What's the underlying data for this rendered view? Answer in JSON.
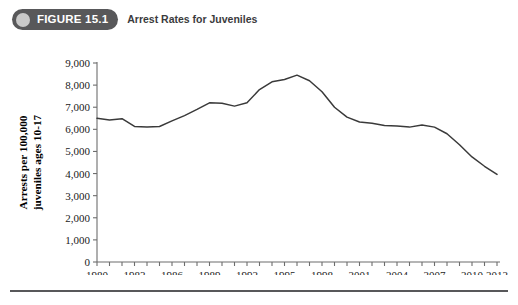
{
  "header": {
    "badge_label": "FIGURE 15.1",
    "badge_icon": "circle-icon",
    "title": "Arrest Rates for Juveniles",
    "badge_color": "#58585a",
    "badge_dot_color": "#c9c9c9",
    "title_color": "#3b3b3d"
  },
  "chart_data": {
    "type": "line",
    "title": "Arrest Rates for Juveniles",
    "xlabel": "",
    "ylabel": "Arrests per 100,000 juveniles ages 10-17",
    "ylabel_line1": "Arrests per 100,000",
    "ylabel_line2": "juveniles ages 10-17",
    "xlim": [
      1980,
      2012
    ],
    "ylim": [
      0,
      9000
    ],
    "ytick_values": [
      0,
      1000,
      2000,
      3000,
      4000,
      5000,
      6000,
      7000,
      8000,
      9000
    ],
    "ytick_labels": [
      "0",
      "1,000",
      "2,000",
      "3,000",
      "4,000",
      "5,000",
      "6,000",
      "7,000",
      "8,000",
      "9,000"
    ],
    "xtick_values": [
      1980,
      1983,
      1986,
      1989,
      1992,
      1995,
      1998,
      2001,
      2004,
      2007,
      2010,
      2012
    ],
    "xtick_labels": [
      "1980",
      "1983",
      "1986",
      "1989",
      "1992",
      "1995",
      "1998",
      "2001",
      "2004",
      "2007",
      "2010",
      "2012"
    ],
    "xtick_minor_every": 1,
    "grid": false,
    "legend": false,
    "line_color": "#3a3a3a",
    "axis_color": "#6d6d6d",
    "x": [
      1980,
      1981,
      1982,
      1983,
      1984,
      1985,
      1986,
      1987,
      1988,
      1989,
      1990,
      1991,
      1992,
      1993,
      1994,
      1995,
      1996,
      1997,
      1998,
      1999,
      2000,
      2001,
      2002,
      2003,
      2004,
      2005,
      2006,
      2007,
      2008,
      2009,
      2010,
      2011,
      2012
    ],
    "series": [
      {
        "name": "Juvenile arrest rate",
        "values": [
          6500,
          6420,
          6480,
          6130,
          6100,
          6130,
          6380,
          6620,
          6900,
          7200,
          7180,
          7050,
          7200,
          7800,
          8150,
          8250,
          8450,
          8200,
          7700,
          7000,
          6550,
          6330,
          6280,
          6170,
          6150,
          6100,
          6200,
          6100,
          5800,
          5300,
          4750,
          4330,
          3960
        ]
      }
    ]
  },
  "footer": {
    "rule_color": "#58585a"
  }
}
